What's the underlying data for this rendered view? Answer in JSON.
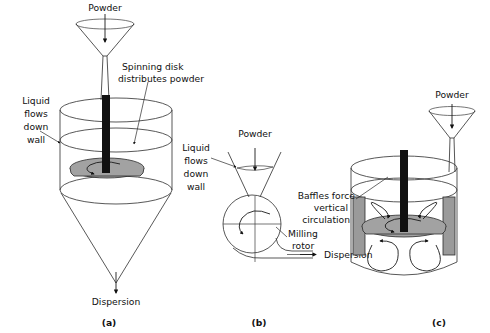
{
  "figure": {
    "background_color": "#ffffff",
    "line_color": "#2b2b2b",
    "disk_fill_color": "#a2a2a2",
    "baffle_fill_color": "#9a9a9a",
    "shaft_color": "#111111",
    "text_color": "#111111"
  },
  "panels": [
    {
      "id": "a",
      "caption": "(a)",
      "name": "spinning-disk-disperser",
      "labels": {
        "powder_inlet": "Powder",
        "spinning_disk": "Spinning disk\ndistributes powder",
        "spinning_disk_line1": "Spinning disk",
        "spinning_disk_line2": "distributes powder",
        "liquid_wall_line1": "Liquid",
        "liquid_wall_line2": "flows",
        "liquid_wall_line3": "down",
        "liquid_wall_line4": "wall",
        "outlet": "Dispersion"
      }
    },
    {
      "id": "b",
      "caption": "(b)",
      "name": "milling-rotor-disperser",
      "labels": {
        "powder_inlet": "Powder",
        "liquid_wall_line1": "Liquid",
        "liquid_wall_line2": "flows",
        "liquid_wall_line3": "down",
        "liquid_wall_line4": "wall",
        "rotor_line1": "Milling",
        "rotor_line2": "rotor",
        "outlet": "Dispersion"
      }
    },
    {
      "id": "c",
      "caption": "(c)",
      "name": "baffled-tank-disperser",
      "labels": {
        "powder_inlet": "Powder",
        "baffles_line1": "Baffles force",
        "baffles_line2": "vertical",
        "baffles_line3": "circulation"
      }
    }
  ],
  "icons": {
    "funnel": "funnel-icon",
    "down_arrow": "down-arrow-icon",
    "rotation_arrow": "rotation-arrow-icon",
    "circulation_loop": "circulation-loop-icon",
    "outlet_arrow": "outlet-arrow-icon"
  }
}
